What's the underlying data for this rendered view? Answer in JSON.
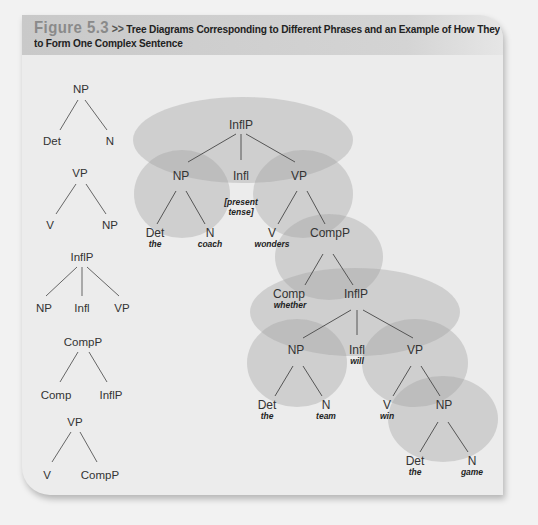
{
  "figure": {
    "number": "Figure 5.3",
    "separator": ">>",
    "title_line1": "Tree Diagrams Corresponding to Different Phrases and an Example of How They Combine",
    "title_line2": "to Form One Complex Sentence"
  },
  "small_trees": [
    {
      "root": "NP",
      "children": [
        "Det",
        "N"
      ]
    },
    {
      "root": "VP",
      "children": [
        "V",
        "NP"
      ]
    },
    {
      "root": "InflP",
      "children": [
        "NP",
        "Infl",
        "VP"
      ]
    },
    {
      "root": "CompP",
      "children": [
        "Comp",
        "InflP"
      ]
    },
    {
      "root": "VP",
      "children": [
        "V",
        "CompP"
      ]
    }
  ],
  "main_tree": {
    "root": {
      "label": "InflP"
    },
    "np1": {
      "label": "NP"
    },
    "infl1": {
      "label": "Infl",
      "note_line1": "[present",
      "note_line2": "tense]"
    },
    "vp1": {
      "label": "VP"
    },
    "det1": {
      "label": "Det",
      "word": "the"
    },
    "n1": {
      "label": "N",
      "word": "coach"
    },
    "v1": {
      "label": "V",
      "word": "wonders"
    },
    "compp": {
      "label": "CompP"
    },
    "comp": {
      "label": "Comp",
      "word": "whether"
    },
    "inflp2": {
      "label": "InflP"
    },
    "np2": {
      "label": "NP"
    },
    "infl2": {
      "label": "Infl",
      "word": "will"
    },
    "vp2": {
      "label": "VP"
    },
    "det2": {
      "label": "Det",
      "word": "the"
    },
    "n2": {
      "label": "N",
      "word": "team"
    },
    "v2": {
      "label": "V",
      "word": "win"
    },
    "np3": {
      "label": "NP"
    },
    "det3": {
      "label": "Det",
      "word": "the"
    },
    "n3": {
      "label": "N",
      "word": "game"
    }
  },
  "colors": {
    "ellipse_fill": "#a8a8a8",
    "line": "#555555",
    "label": "#333333",
    "title_band": "#cfcfcf",
    "figure_number": "#8a8a8a"
  }
}
